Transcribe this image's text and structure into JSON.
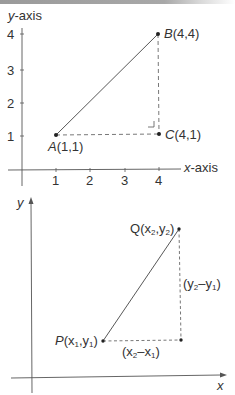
{
  "diagram1": {
    "y_axis_label_italic": "y",
    "y_axis_label_rest": "-axis",
    "x_axis_label_italic": "x",
    "x_axis_label_rest": "-axis",
    "x_ticks": [
      "1",
      "2",
      "3",
      "4"
    ],
    "y_ticks": [
      "1",
      "2",
      "3",
      "4"
    ],
    "points": {
      "A": {
        "name": "A",
        "coords": "(1,1)",
        "x": 1,
        "y": 1
      },
      "B": {
        "name": "B",
        "coords": "(4,4)",
        "x": 4,
        "y": 4
      },
      "C": {
        "name": "C",
        "coords": "(4,1)",
        "x": 4,
        "y": 1
      }
    }
  },
  "diagram2": {
    "y_axis_label": "y",
    "x_axis_label": "x",
    "P": {
      "name": "P",
      "open": "(x",
      "sub1": "1",
      "mid": ",y",
      "sub2": "1",
      "close": ")"
    },
    "Q": {
      "name": "Q",
      "open": "(x",
      "sub1": "2",
      "mid": ",y",
      "sub2": "2",
      "close": ")"
    },
    "dx": {
      "open": "(x",
      "sub1": "2",
      "mid": "–x",
      "sub2": "1",
      "close": ")"
    },
    "dy": {
      "open": "(y",
      "sub1": "2",
      "mid": "–y",
      "sub2": "1",
      "close": ")"
    }
  },
  "colors": {
    "line": "#444444",
    "text": "#333333",
    "point": "#222222"
  }
}
